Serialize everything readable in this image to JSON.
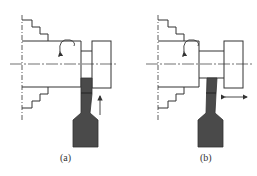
{
  "figure": {
    "panels": [
      {
        "id": "a",
        "label": "(a)",
        "feed_direction": "radial (upward)"
      },
      {
        "id": "b",
        "label": "(b)",
        "feed_direction": "axial (left-right)"
      }
    ]
  },
  "colors": {
    "line": "#333333",
    "tool": "#4a4a4a",
    "background": "#ffffff"
  }
}
